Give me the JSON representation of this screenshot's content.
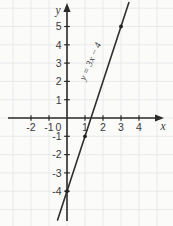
{
  "chart_data": {
    "type": "line",
    "title": "",
    "xlabel": "x",
    "ylabel": "y",
    "xlim": [
      -2.8,
      5.4
    ],
    "ylim": [
      -5.9,
      6.3
    ],
    "x_ticks": [
      -2,
      -1,
      0,
      1,
      2,
      3,
      4
    ],
    "y_ticks": [
      -4,
      -3,
      -2,
      -1,
      1,
      2,
      3,
      4,
      5
    ],
    "grid": true,
    "legend_position": "none",
    "series": [
      {
        "name": "y = 3x − 4",
        "equation_label": "y = 3x − 4",
        "slope": 3,
        "intercept": -4,
        "marked_points": [
          [
            0,
            -4
          ],
          [
            1,
            -1
          ],
          [
            3,
            5
          ]
        ]
      }
    ],
    "colors": {
      "line": "#2f2f2f",
      "axis": "#2a2a2a",
      "grid": "#e7e8ea",
      "labels": "#3a3a3a",
      "point": "#222222",
      "background": "#fbfbfa"
    }
  }
}
